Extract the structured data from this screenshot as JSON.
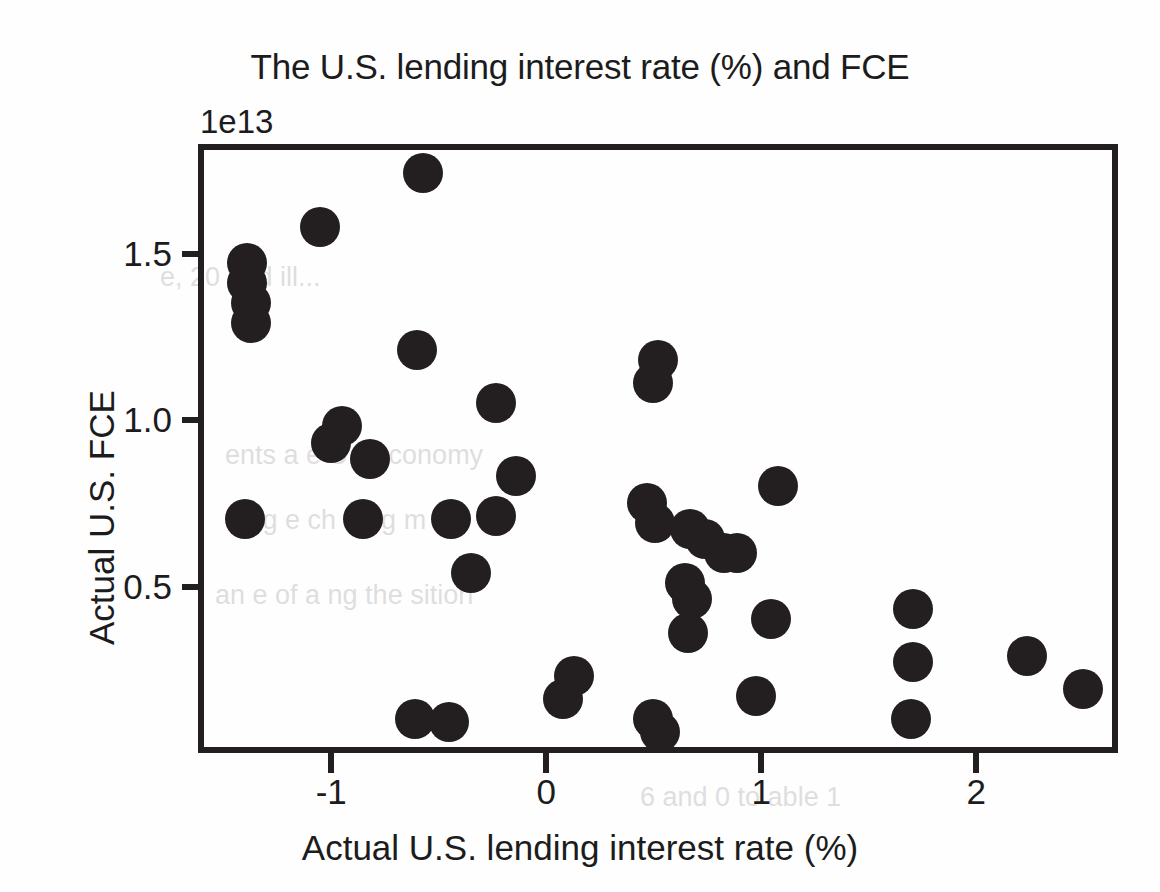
{
  "chart_data": {
    "type": "scatter",
    "title": "The U.S. lending interest rate (%) and FCE",
    "xlabel": "Actual U.S. lending interest rate (%)",
    "ylabel": "Actual U.S. FCE",
    "y_offset_label": "1e13",
    "y_scale": 10000000000000.0,
    "xlim": [
      -1.62,
      2.66
    ],
    "ylim": [
      0.0,
      1.83
    ],
    "xticks": [
      -1,
      0,
      1,
      2
    ],
    "xtick_labels": [
      "-1",
      "0",
      "1",
      "2"
    ],
    "yticks": [
      0.5,
      1.0,
      1.5
    ],
    "ytick_labels": [
      "0.5",
      "1.0",
      "1.5"
    ],
    "grid": false,
    "legend": false,
    "marker": {
      "shape": "circle",
      "color": "#231f20",
      "size_px": 40
    },
    "series": [
      {
        "name": "U.S. lending interest rate vs FCE",
        "points": [
          {
            "x": -0.6,
            "y": 1.76
          },
          {
            "x": -1.08,
            "y": 1.6
          },
          {
            "x": -1.42,
            "y": 1.49
          },
          {
            "x": -1.42,
            "y": 1.43
          },
          {
            "x": -1.4,
            "y": 1.37
          },
          {
            "x": -1.4,
            "y": 1.31
          },
          {
            "x": -0.63,
            "y": 1.23
          },
          {
            "x": 0.49,
            "y": 1.2
          },
          {
            "x": 0.47,
            "y": 1.13
          },
          {
            "x": -0.26,
            "y": 1.07
          },
          {
            "x": -0.98,
            "y": 1.0
          },
          {
            "x": -1.03,
            "y": 0.95
          },
          {
            "x": -0.85,
            "y": 0.9
          },
          {
            "x": -0.17,
            "y": 0.85
          },
          {
            "x": 1.05,
            "y": 0.82
          },
          {
            "x": 0.44,
            "y": 0.77
          },
          {
            "x": -1.43,
            "y": 0.72
          },
          {
            "x": -0.88,
            "y": 0.72
          },
          {
            "x": -0.47,
            "y": 0.72
          },
          {
            "x": -0.26,
            "y": 0.73
          },
          {
            "x": 0.48,
            "y": 0.71
          },
          {
            "x": 0.64,
            "y": 0.69
          },
          {
            "x": 0.71,
            "y": 0.66
          },
          {
            "x": 0.86,
            "y": 0.62
          },
          {
            "x": 0.8,
            "y": 0.62
          },
          {
            "x": -0.38,
            "y": 0.56
          },
          {
            "x": 0.62,
            "y": 0.53
          },
          {
            "x": 0.65,
            "y": 0.48
          },
          {
            "x": 1.68,
            "y": 0.45
          },
          {
            "x": 1.02,
            "y": 0.42
          },
          {
            "x": 0.63,
            "y": 0.38
          },
          {
            "x": 2.21,
            "y": 0.31
          },
          {
            "x": 1.68,
            "y": 0.29
          },
          {
            "x": 0.1,
            "y": 0.25
          },
          {
            "x": 2.47,
            "y": 0.21
          },
          {
            "x": 0.95,
            "y": 0.19
          },
          {
            "x": 0.05,
            "y": 0.18
          },
          {
            "x": -0.64,
            "y": 0.12
          },
          {
            "x": -0.48,
            "y": 0.11
          },
          {
            "x": 0.47,
            "y": 0.12
          },
          {
            "x": 0.5,
            "y": 0.08
          },
          {
            "x": 1.67,
            "y": 0.12
          }
        ]
      }
    ]
  },
  "background_text": [
    "e, 20   and ill...",
    "ents a   e U.S.   conomy",
    "d   ng   e   ch   e   ng m   el",
    "an   e of   a   ng  the   sition",
    "6 and   0   to   able 1"
  ]
}
